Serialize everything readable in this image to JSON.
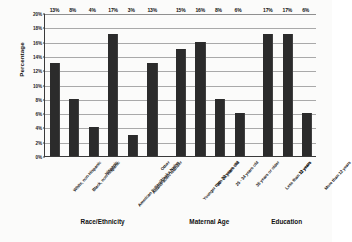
{
  "chart_data": {
    "type": "bar",
    "title": "",
    "xlabel": "",
    "ylabel": "Percentage",
    "ylim": [
      0,
      20
    ],
    "ytick_labels": [
      "0%",
      "2%",
      "4%",
      "6%",
      "8%",
      "10%",
      "12%",
      "14%",
      "16%",
      "18%",
      "20%"
    ],
    "ytick_values": [
      0,
      2,
      4,
      6,
      8,
      10,
      12,
      14,
      16,
      18,
      20
    ],
    "grid": true,
    "legend": "none",
    "bar_color": "#2b2b2b",
    "categories": [
      "White, non-Hispanic",
      "Black, non-Hispanic",
      "Hispanic",
      "American Indian/Alaska Native",
      "Asian/Pacific Islander",
      "Other",
      "Younger than 20 years old",
      "20 - 24 years old",
      "25 - 34 years old",
      "35 years or older",
      "Less than 12 years",
      "12 years",
      "More than 12 years"
    ],
    "values": [
      13,
      8,
      4,
      17,
      3,
      13,
      15,
      16,
      8,
      6,
      17,
      17,
      6
    ],
    "value_labels": [
      "13%",
      "8%",
      "4%",
      "17%",
      "3%",
      "13%",
      "15%",
      "16%",
      "8%",
      "6%",
      "17%",
      "17%",
      "6%"
    ],
    "groups": [
      {
        "title": "Race/Ethnicity",
        "start": 0,
        "count": 6
      },
      {
        "title": "Maternal Age",
        "start": 6,
        "count": 4
      },
      {
        "title": "Education",
        "start": 10,
        "count": 3
      }
    ]
  }
}
